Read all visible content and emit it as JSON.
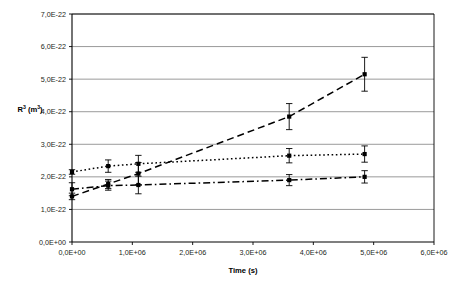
{
  "chart_data": {
    "type": "line",
    "title": "",
    "xlabel": "Time (s)",
    "ylabel": "R³ (m³)",
    "ylabel_parts": {
      "base": "R",
      "sup1": "3",
      "mid": " (m",
      "sup2": "3",
      "end": ")"
    },
    "xlim": [
      0,
      6000000
    ],
    "ylim": [
      0,
      7e-22
    ],
    "grid": "horizontal",
    "legend": "none",
    "xticks": [
      0,
      1000000,
      2000000,
      3000000,
      4000000,
      5000000,
      6000000
    ],
    "xticklabels": [
      "0,0E+00",
      "1,0E+06",
      "2,0E+06",
      "3,0E+06",
      "4,0E+06",
      "5,0E+06",
      "6,0E+06"
    ],
    "yticks": [
      0,
      1e-22,
      2e-22,
      3e-22,
      4e-22,
      5e-22,
      6e-22,
      7e-22
    ],
    "yticklabels": [
      "0,0E+00",
      "1,0E-22",
      "2,0E-22",
      "3,0E-22",
      "4,0E-22",
      "5,0E-22",
      "6,0E-22",
      "7,0E-22"
    ],
    "series": [
      {
        "name": "series-dashed",
        "linestyle": "dashed",
        "marker": "square",
        "x": [
          0,
          600000,
          1100000,
          3600000,
          4850000
        ],
        "y": [
          1.4e-22,
          1.78e-22,
          2.1e-22,
          3.85e-22,
          5.15e-22
        ],
        "yerr": [
          1e-23,
          1.4e-23,
          3.4e-23,
          4e-23,
          5.2e-23
        ]
      },
      {
        "name": "series-dotted",
        "linestyle": "dotted",
        "marker": "square",
        "x": [
          0,
          600000,
          1100000,
          3600000,
          4850000
        ],
        "y": [
          2.15e-22,
          2.33e-22,
          2.4e-22,
          2.65e-22,
          2.7e-22
        ],
        "yerr": [
          7e-24,
          1.9e-23,
          2.6e-23,
          2.2e-23,
          2.5e-23
        ]
      },
      {
        "name": "series-dash-dot",
        "linestyle": "dash-dot",
        "marker": "square",
        "x": [
          0,
          600000,
          1100000,
          3600000,
          4850000
        ],
        "y": [
          1.62e-22,
          1.73e-22,
          1.75e-22,
          1.9e-22,
          2e-22
        ],
        "yerr": [
          2e-23,
          1.4e-23,
          2.7e-23,
          1.7e-23,
          1.9e-23
        ]
      }
    ],
    "colors": {
      "line": "#000000",
      "grid": "#808080",
      "frame": "#000000",
      "text": "#231f20"
    }
  }
}
